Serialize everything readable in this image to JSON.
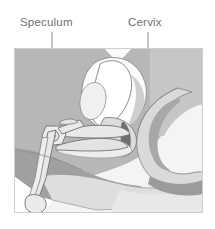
{
  "figure": {
    "type": "anatomical-illustration",
    "view": "sagittal cross-section of the female pelvis",
    "canvas": {
      "width": 215,
      "height": 229
    },
    "frame": {
      "x": 14,
      "y": 48,
      "width": 189,
      "height": 165
    },
    "background_color": "#ffffff"
  },
  "labels": [
    {
      "id": "speculum",
      "text": "Speculum",
      "text_x": 20,
      "text_y": 26,
      "color": "#6e6e6e",
      "leader": {
        "x": 52,
        "y1": 32,
        "y2": 130,
        "color": "#8d8d8d"
      }
    },
    {
      "id": "cervix",
      "text": "Cervix",
      "text_x": 128,
      "text_y": 26,
      "color": "#6e6e6e",
      "leader": {
        "x": 148,
        "y1": 32,
        "y2": 135,
        "color": "#8d8d8d"
      }
    }
  ],
  "palette": {
    "frame_border": "#cfcfcf",
    "panel_light": "#f2f2f2",
    "tissue_mid": "#b4b4b4",
    "tissue_dark": "#9a9a9a",
    "tissue_darkest": "#878787",
    "tissue_light": "#dcdcdc",
    "tissue_lighter": "#ebebeb",
    "organ_white": "#fbfbfb",
    "instrument_fill": "#e4e4e4",
    "outline": "#7a7a7a",
    "outline_soft": "#9e9e9e",
    "text": "#6e6e6e"
  },
  "structures": [
    {
      "name": "abdominal-wall-mass",
      "tone": "tissue_mid"
    },
    {
      "name": "pubic-bone",
      "tone": "tissue_dark"
    },
    {
      "name": "bladder",
      "tone": "organ_white"
    },
    {
      "name": "uterus-body",
      "tone": "organ_white"
    },
    {
      "name": "cervix",
      "tone": "tissue_light"
    },
    {
      "name": "vaginal-canal",
      "tone": "tissue_lighter"
    },
    {
      "name": "rectum",
      "tone": "tissue_light"
    },
    {
      "name": "sacrum",
      "tone": "tissue_mid"
    },
    {
      "name": "perineum",
      "tone": "tissue_dark"
    }
  ],
  "instrument": {
    "name": "vaginal-speculum",
    "parts": [
      "upper-blade",
      "lower-blade",
      "pivot-joint",
      "handle-arm",
      "thumb-rest"
    ],
    "fill": "#e8e8e8",
    "stroke": "#808080"
  }
}
